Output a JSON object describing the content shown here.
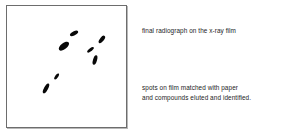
{
  "figure": {
    "film": {
      "label": "x-ray-film-panel",
      "border_color": "#6d6d6d",
      "background_color": "#ffffff",
      "spot_color": "#080808",
      "spots": [
        {
          "name": "spot-1",
          "left": 64.5,
          "top": 22.5,
          "width": 4.2,
          "height": 9.0,
          "rotate": 62,
          "intensity": "dark"
        },
        {
          "name": "spot-2",
          "left": 54.0,
          "top": 33.5,
          "width": 5.6,
          "height": 12.0,
          "rotate": 52,
          "intensity": "dark"
        },
        {
          "name": "spot-3",
          "left": 93.0,
          "top": 29.0,
          "width": 4.0,
          "height": 8.6,
          "rotate": 38,
          "intensity": "dark"
        },
        {
          "name": "spot-4",
          "left": 81.5,
          "top": 39.5,
          "width": 3.4,
          "height": 7.8,
          "rotate": 52,
          "intensity": "medium"
        },
        {
          "name": "spot-5",
          "left": 86.0,
          "top": 49.0,
          "width": 4.0,
          "height": 10.0,
          "rotate": 16,
          "intensity": "dark"
        },
        {
          "name": "spot-6",
          "left": 47.5,
          "top": 66.5,
          "width": 3.2,
          "height": 7.4,
          "rotate": 35,
          "intensity": "medium"
        },
        {
          "name": "spot-7",
          "left": 36.5,
          "top": 76.5,
          "width": 4.2,
          "height": 11.0,
          "rotate": 28,
          "intensity": "dark"
        }
      ]
    },
    "captions": {
      "top": "final radiograph on the x-ray film",
      "bottom_line1": "spots on film matched with paper",
      "bottom_line2": "and compounds eluted and identified."
    }
  }
}
